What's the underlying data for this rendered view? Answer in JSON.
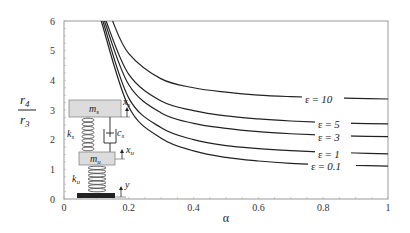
{
  "chart_data": {
    "type": "line",
    "title": "",
    "xlabel": "α",
    "ylabel": "r4 / r3",
    "ylabel_num": "r",
    "ylabel_num_sub": "4",
    "ylabel_den": "r",
    "ylabel_den_sub": "3",
    "xlim": [
      0,
      1
    ],
    "ylim": [
      0,
      6
    ],
    "x_ticks": [
      "0",
      "0.2",
      "0.4",
      "0.6",
      "0.8",
      "1"
    ],
    "y_ticks": [
      "0",
      "1",
      "2",
      "3",
      "4",
      "5",
      "6"
    ],
    "grid": false,
    "legend": "inline labels near right edge",
    "series": [
      {
        "name": "ε = 10",
        "eps": "10",
        "x": [
          0.15,
          0.2,
          0.3,
          0.4,
          0.5,
          0.6,
          0.7,
          0.8,
          0.9,
          1.0
        ],
        "y": [
          6.0,
          4.9,
          4.05,
          3.75,
          3.6,
          3.5,
          3.45,
          3.42,
          3.39,
          3.37
        ]
      },
      {
        "name": "ε = 5",
        "eps": "5",
        "x": [
          0.13,
          0.2,
          0.3,
          0.4,
          0.5,
          0.6,
          0.7,
          0.8,
          0.9,
          1.0
        ],
        "y": [
          6.0,
          4.2,
          3.3,
          2.98,
          2.8,
          2.7,
          2.63,
          2.58,
          2.55,
          2.53
        ]
      },
      {
        "name": "ε = 3",
        "eps": "3",
        "x": [
          0.125,
          0.2,
          0.3,
          0.4,
          0.5,
          0.6,
          0.7,
          0.8,
          0.9,
          1.0
        ],
        "y": [
          6.0,
          3.85,
          2.9,
          2.55,
          2.38,
          2.27,
          2.2,
          2.15,
          2.12,
          2.1
        ]
      },
      {
        "name": "ε = 1",
        "eps": "1",
        "x": [
          0.12,
          0.2,
          0.3,
          0.4,
          0.5,
          0.6,
          0.7,
          0.8,
          0.9,
          1.0
        ],
        "y": [
          6.0,
          3.4,
          2.4,
          2.0,
          1.8,
          1.7,
          1.63,
          1.58,
          1.55,
          1.52
        ]
      },
      {
        "name": "ε = 0.1",
        "eps": "0.1",
        "x": [
          0.115,
          0.2,
          0.3,
          0.4,
          0.5,
          0.6,
          0.7,
          0.8,
          0.9,
          1.0
        ],
        "y": [
          6.0,
          3.1,
          2.05,
          1.62,
          1.4,
          1.28,
          1.2,
          1.16,
          1.13,
          1.11
        ]
      }
    ],
    "annotations": [
      "quarter-car model inset: m_s, m_u, k_s, k_u, c_s, x_s, x_u, y"
    ]
  },
  "inset": {
    "sprung_mass": "m",
    "sprung_mass_sub": "s",
    "unsprung_mass": "m",
    "unsprung_mass_sub": "u",
    "spring_s": "k",
    "spring_s_sub": "s",
    "spring_u": "k",
    "spring_u_sub": "u",
    "damper": "c",
    "damper_sub": "s",
    "disp_s": "x",
    "disp_s_sub": "s",
    "disp_u": "x",
    "disp_u_sub": "u",
    "disp_road": "y"
  },
  "eps_symbol": "ε ="
}
